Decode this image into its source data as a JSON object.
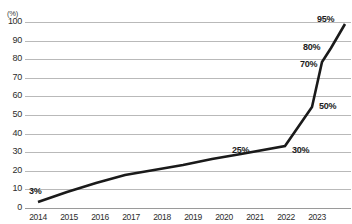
{
  "chart_data": {
    "type": "line",
    "title": "",
    "xlabel": "",
    "ylabel": "(%)",
    "unit_label": "(%)",
    "categories": [
      "2014",
      "2015",
      "2016",
      "2017",
      "2018",
      "2019",
      "2020",
      "2021",
      "2022",
      "2023"
    ],
    "x": [
      2014,
      2015,
      2016,
      2017,
      2018,
      2019,
      2020,
      2021,
      2022,
      2023
    ],
    "values": [
      3,
      8,
      13,
      17,
      20,
      22,
      24,
      25,
      30,
      50
    ],
    "extra_points": [
      {
        "value": 70,
        "label": "70%"
      },
      {
        "value": 80,
        "label": "80%"
      },
      {
        "value": 95,
        "label": "95%"
      }
    ],
    "ylim": [
      0,
      100
    ],
    "yticks": [
      0,
      10,
      20,
      30,
      40,
      50,
      60,
      70,
      80,
      90,
      100
    ],
    "ytick_labels": [
      "0",
      "10",
      "20",
      "30",
      "40",
      "50",
      "60",
      "70",
      "80",
      "90",
      "100"
    ],
    "grid": true,
    "legend": "none",
    "line_color": "#1a1a1a",
    "grid_color": "#b9b9b9",
    "data_labels": [
      {
        "text": "3%",
        "value": 3,
        "x_px": 29,
        "y_px": 186
      },
      {
        "text": "25%",
        "value": 25,
        "x_px": 232,
        "y_px": 145
      },
      {
        "text": "30%",
        "value": 30,
        "x_px": 292,
        "y_px": 145
      },
      {
        "text": "50%",
        "value": 50,
        "x_px": 319,
        "y_px": 101
      },
      {
        "text": "70%",
        "value": 70,
        "x_px": 300,
        "y_px": 59
      },
      {
        "text": "80%",
        "value": 80,
        "x_px": 303,
        "y_px": 42
      },
      {
        "text": "95%",
        "value": 95,
        "x_px": 317,
        "y_px": 14
      }
    ],
    "polyline_px": "38,202 67,192 96,183 125,175 154,170 183,165 212,159 241,154 285,146 312,107 322,62 331,48 345,24"
  }
}
